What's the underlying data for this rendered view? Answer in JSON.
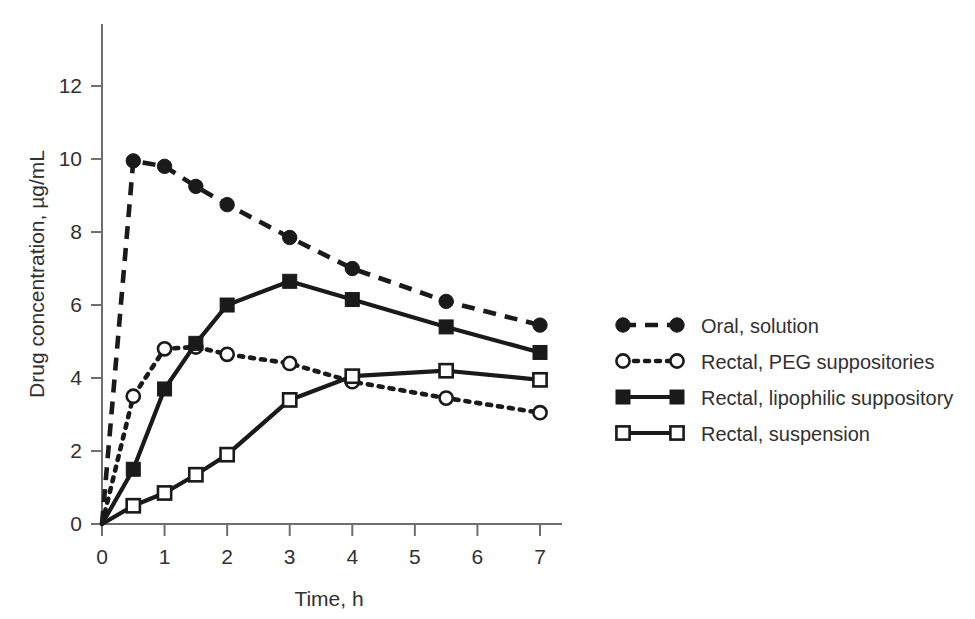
{
  "chart_data": {
    "type": "line",
    "title": "",
    "xlabel": "Time, h",
    "ylabel": "Drug concentration, µg/mL",
    "xlim": [
      0,
      7
    ],
    "ylim": [
      0,
      13.7
    ],
    "xticks": [
      0,
      1,
      2,
      3,
      4,
      5,
      6,
      7
    ],
    "xticklabels": [
      "0",
      "1",
      "2",
      "3",
      "4",
      "5",
      "6",
      "7"
    ],
    "yticks": [
      0,
      2,
      4,
      6,
      8,
      10,
      12
    ],
    "yticklabels": [
      "0",
      "2",
      "4",
      "6",
      "8",
      "10",
      "12"
    ],
    "grid": false,
    "legend_position": "right",
    "series": [
      {
        "name": "Oral, solution",
        "marker": "filled-circle",
        "linestyle": "dashed",
        "color": "#1a1a1a",
        "x": [
          0,
          0.5,
          1,
          1.5,
          2,
          3,
          4,
          5.5,
          7
        ],
        "y": [
          0,
          9.95,
          9.8,
          9.25,
          8.75,
          7.85,
          7.0,
          6.1,
          5.45
        ]
      },
      {
        "name": "Rectal, PEG suppositories",
        "marker": "open-circle",
        "linestyle": "dotted",
        "color": "#1a1a1a",
        "x": [
          0,
          0.5,
          1,
          1.5,
          2,
          3,
          4,
          5.5,
          7
        ],
        "y": [
          0,
          3.5,
          4.8,
          4.85,
          4.65,
          4.4,
          3.9,
          3.45,
          3.05
        ]
      },
      {
        "name": "Rectal, lipophilic suppository",
        "marker": "filled-square",
        "linestyle": "solid",
        "color": "#1a1a1a",
        "x": [
          0,
          0.5,
          1,
          1.5,
          2,
          3,
          4,
          5.5,
          7
        ],
        "y": [
          0,
          1.5,
          3.7,
          4.95,
          6.0,
          6.65,
          6.15,
          5.4,
          4.7
        ]
      },
      {
        "name": "Rectal, suspension",
        "marker": "open-square",
        "linestyle": "solid",
        "color": "#1a1a1a",
        "x": [
          0,
          0.5,
          1,
          1.5,
          2,
          3,
          4,
          5.5,
          7
        ],
        "y": [
          0,
          0.5,
          0.85,
          1.35,
          1.9,
          3.4,
          4.05,
          4.2,
          3.95
        ]
      }
    ]
  },
  "legend": {
    "entries": [
      {
        "label": "Oral, solution"
      },
      {
        "label": "Rectal, PEG suppositories"
      },
      {
        "label": "Rectal, lipophilic suppository"
      },
      {
        "label": "Rectal, suspension"
      }
    ]
  }
}
